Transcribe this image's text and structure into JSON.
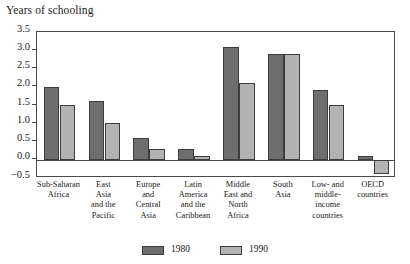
{
  "chart_data": {
    "type": "bar",
    "title": "Years of schooling",
    "xlabel": "",
    "ylabel": "Years of schooling",
    "ylim": [
      -0.5,
      3.5
    ],
    "yticks": [
      "3.5",
      "3.0",
      "2.5",
      "2.0",
      "1.5",
      "1.0",
      "0.5",
      "0.0",
      "-0.5"
    ],
    "ytick_values": [
      3.5,
      3.0,
      2.5,
      2.0,
      1.5,
      1.0,
      0.5,
      0.0,
      -0.5
    ],
    "grid": false,
    "legend_position": "bottom",
    "categories": [
      "Sub-Saharan Africa",
      "East Asia and the Pacific",
      "Europe and Central Asia",
      "Latin America and the Caribbean",
      "Middle East and North Africa",
      "South Asia",
      "Low- and middle-income countries",
      "OECD countries"
    ],
    "category_lines": [
      [
        "Sub-Saharan",
        "Africa"
      ],
      [
        "East",
        "Asia",
        "and the",
        "Pacific"
      ],
      [
        "Europe",
        "and",
        "Central",
        "Asia"
      ],
      [
        "Latin",
        "America",
        "and the",
        "Caribbean"
      ],
      [
        "Middle",
        "East and",
        "North",
        "Africa"
      ],
      [
        "South",
        "Asia"
      ],
      [
        "Low- and",
        "middle-",
        "income",
        "countries"
      ],
      [
        "OECD",
        "countries"
      ]
    ],
    "series": [
      {
        "name": "1980",
        "color": "#6e6e6e",
        "values": [
          2.0,
          1.6,
          0.6,
          0.3,
          3.1,
          2.9,
          1.9,
          0.1
        ]
      },
      {
        "name": "1990",
        "color": "#b3b3b3",
        "values": [
          1.5,
          1.0,
          0.3,
          0.1,
          2.1,
          2.9,
          1.5,
          -0.4
        ]
      }
    ]
  },
  "legend": {
    "entries": [
      {
        "label": "1980"
      },
      {
        "label": "1990"
      }
    ]
  },
  "colors": {
    "series_1980": "#6e6e6e",
    "series_1990": "#b3b3b3",
    "axis": "#4a4a4a",
    "text": "#1a1a1a",
    "background": "#ffffff"
  }
}
